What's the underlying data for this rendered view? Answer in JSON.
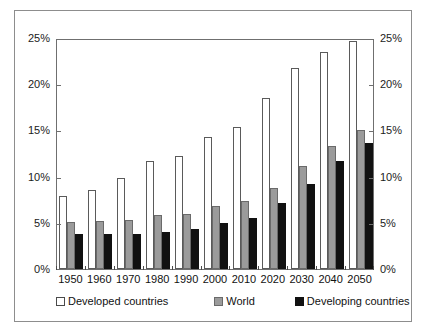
{
  "chart_data": {
    "type": "bar",
    "title": "",
    "subtitle": "",
    "xlabel": "",
    "ylabel": "",
    "ylim": [
      0,
      25
    ],
    "yunit": "%",
    "grid": false,
    "legend_position": "bottom",
    "dual_y_axis": true,
    "categories": [
      "1950",
      "1960",
      "1970",
      "1980",
      "1990",
      "2000",
      "2010",
      "2020",
      "2030",
      "2040",
      "2050"
    ],
    "y_ticks": [
      "0%",
      "5%",
      "10%",
      "15%",
      "20%",
      "25%"
    ],
    "y_tick_values": [
      0,
      5,
      10,
      15,
      20,
      25
    ],
    "series": [
      {
        "name": "Developed countries",
        "color": "#ffffff",
        "values": [
          7.9,
          8.6,
          9.9,
          11.7,
          12.2,
          14.3,
          15.4,
          18.5,
          21.8,
          23.5,
          24.7
        ]
      },
      {
        "name": "World",
        "color": "#9b9b9b",
        "values": [
          5.1,
          5.2,
          5.3,
          5.8,
          6.0,
          6.8,
          7.4,
          8.8,
          11.1,
          13.3,
          15.0
        ]
      },
      {
        "name": "Developing countries",
        "color": "#111111",
        "values": [
          3.8,
          3.8,
          3.8,
          4.0,
          4.3,
          5.0,
          5.5,
          7.1,
          9.2,
          11.7,
          13.6
        ]
      }
    ]
  },
  "legend": {
    "items": [
      {
        "label": "Developed countries",
        "swatch": "developed"
      },
      {
        "label": "World",
        "swatch": "world"
      },
      {
        "label": "Developing countries",
        "swatch": "developing"
      }
    ]
  }
}
